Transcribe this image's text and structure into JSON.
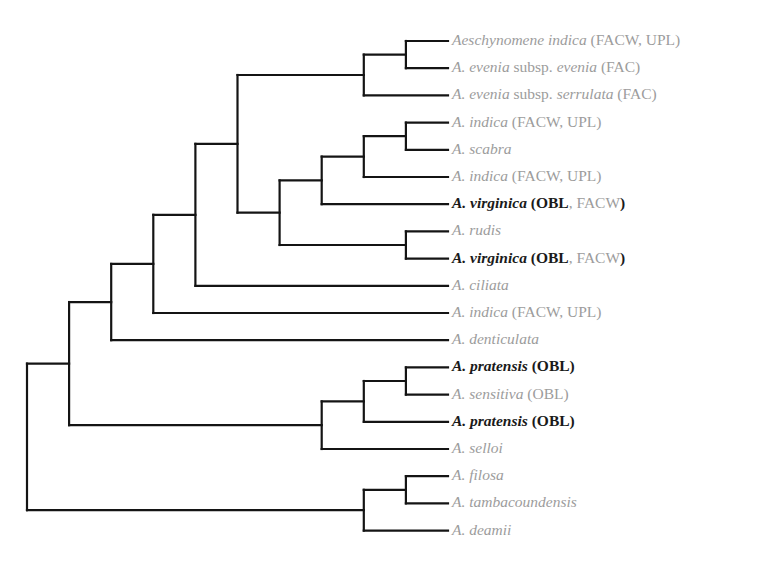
{
  "colors": {
    "branch": "#141414",
    "label_default": "#9c9c9c",
    "label_highlight": "#1a1a1a"
  },
  "leaves": [
    {
      "id": "L1",
      "parts": [
        {
          "t": "Aeschynomene indica",
          "i": true
        },
        {
          "t": " (FACW, UPL)"
        }
      ],
      "highlight": false
    },
    {
      "id": "L2",
      "parts": [
        {
          "t": "A. evenia",
          "i": true
        },
        {
          "t": " subsp. "
        },
        {
          "t": "evenia",
          "i": true
        },
        {
          "t": " (FAC)"
        }
      ],
      "highlight": false
    },
    {
      "id": "L3",
      "parts": [
        {
          "t": "A. evenia",
          "i": true
        },
        {
          "t": " subsp. "
        },
        {
          "t": "serrulata",
          "i": true
        },
        {
          "t": " (FAC)"
        }
      ],
      "highlight": false
    },
    {
      "id": "L4",
      "parts": [
        {
          "t": "A. indica",
          "i": true
        },
        {
          "t": " (FACW, UPL)"
        }
      ],
      "highlight": false
    },
    {
      "id": "L5",
      "parts": [
        {
          "t": "A. scabra",
          "i": true
        }
      ],
      "highlight": false
    },
    {
      "id": "L6",
      "parts": [
        {
          "t": "A. indica",
          "i": true
        },
        {
          "t": " (FACW, UPL)"
        }
      ],
      "highlight": false
    },
    {
      "id": "L7",
      "parts": [
        {
          "t": "A. virginica",
          "i": true,
          "b": true
        },
        {
          "t": " (",
          "b": true
        },
        {
          "t": "OBL",
          "b": true
        },
        {
          "t": ", FACW"
        },
        {
          "t": ")",
          "b": true
        }
      ],
      "highlight": true
    },
    {
      "id": "L8",
      "parts": [
        {
          "t": "A. rudis",
          "i": true
        }
      ],
      "highlight": false
    },
    {
      "id": "L9",
      "parts": [
        {
          "t": "A. virginica",
          "i": true,
          "b": true
        },
        {
          "t": " (",
          "b": true
        },
        {
          "t": "OBL",
          "b": true
        },
        {
          "t": ", FACW"
        },
        {
          "t": ")",
          "b": true
        }
      ],
      "highlight": true
    },
    {
      "id": "L10",
      "parts": [
        {
          "t": "A. ciliata",
          "i": true
        }
      ],
      "highlight": false
    },
    {
      "id": "L11",
      "parts": [
        {
          "t": "A. indica",
          "i": true
        },
        {
          "t": " (FACW, UPL)"
        }
      ],
      "highlight": false
    },
    {
      "id": "L12",
      "parts": [
        {
          "t": "A. denticulata",
          "i": true
        }
      ],
      "highlight": false
    },
    {
      "id": "L13",
      "parts": [
        {
          "t": "A. pratensis",
          "i": true,
          "b": true
        },
        {
          "t": " (OBL)",
          "b": true
        }
      ],
      "highlight": true
    },
    {
      "id": "L14",
      "parts": [
        {
          "t": "A. sensitiva",
          "i": true
        },
        {
          "t": " (OBL)"
        }
      ],
      "highlight": false
    },
    {
      "id": "L15",
      "parts": [
        {
          "t": "A. pratensis",
          "i": true,
          "b": true
        },
        {
          "t": " (OBL)",
          "b": true
        }
      ],
      "highlight": true
    },
    {
      "id": "L16",
      "parts": [
        {
          "t": "A. selloi",
          "i": true
        }
      ],
      "highlight": false
    },
    {
      "id": "L17",
      "parts": [
        {
          "t": "A. filosa",
          "i": true
        }
      ],
      "highlight": false
    },
    {
      "id": "L18",
      "parts": [
        {
          "t": "A. tambacoundensis",
          "i": true
        }
      ],
      "highlight": false
    },
    {
      "id": "L19",
      "parts": [
        {
          "t": "A. deamii",
          "i": true
        }
      ],
      "highlight": false
    }
  ],
  "tree": {
    "id": "root",
    "depth": 0,
    "children": [
      {
        "id": "n1",
        "depth": 1,
        "children": [
          {
            "id": "n2",
            "depth": 2,
            "children": [
              {
                "id": "n3",
                "depth": 3,
                "children": [
                  {
                    "id": "n4",
                    "depth": 4,
                    "children": [
                      {
                        "id": "n5",
                        "depth": 5,
                        "children": [
                          {
                            "id": "n6",
                            "depth": 8,
                            "children": [
                              {
                                "id": "n6a",
                                "depth": 9,
                                "children": [
                                  {
                                    "leaf": "L1"
                                  },
                                  {
                                    "leaf": "L2"
                                  }
                                ]
                              },
                              {
                                "leaf": "L3"
                              }
                            ]
                          },
                          {
                            "id": "n7",
                            "depth": 6,
                            "children": [
                              {
                                "id": "n8",
                                "depth": 7,
                                "children": [
                                  {
                                    "id": "n8a",
                                    "depth": 8,
                                    "children": [
                                      {
                                        "id": "n8b",
                                        "depth": 9,
                                        "children": [
                                          {
                                            "leaf": "L4"
                                          },
                                          {
                                            "leaf": "L5"
                                          }
                                        ]
                                      },
                                      {
                                        "leaf": "L6"
                                      }
                                    ]
                                  },
                                  {
                                    "leaf": "L7"
                                  }
                                ]
                              },
                              {
                                "id": "n9",
                                "depth": 9,
                                "children": [
                                  {
                                    "leaf": "L8"
                                  },
                                  {
                                    "leaf": "L9"
                                  }
                                ]
                              }
                            ]
                          }
                        ]
                      },
                      {
                        "leaf": "L10"
                      }
                    ]
                  },
                  {
                    "leaf": "L11"
                  }
                ]
              },
              {
                "leaf": "L12"
              }
            ]
          },
          {
            "id": "np",
            "depth": 7,
            "children": [
              {
                "id": "np2",
                "depth": 8,
                "children": [
                  {
                    "id": "np3",
                    "depth": 9,
                    "children": [
                      {
                        "leaf": "L13"
                      },
                      {
                        "leaf": "L14"
                      }
                    ]
                  },
                  {
                    "leaf": "L15"
                  }
                ]
              },
              {
                "leaf": "L16"
              }
            ]
          }
        ]
      },
      {
        "id": "nf",
        "depth": 8,
        "children": [
          {
            "id": "nf2",
            "depth": 9,
            "children": [
              {
                "leaf": "L17"
              },
              {
                "leaf": "L18"
              }
            ]
          },
          {
            "leaf": "L19"
          }
        ]
      }
    ]
  }
}
